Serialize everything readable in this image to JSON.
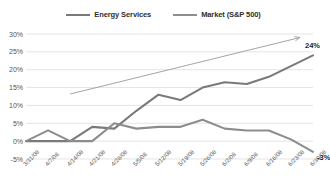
{
  "chart_data": {
    "type": "line",
    "title": "",
    "xlabel": "",
    "ylabel": "",
    "ylim": [
      -5,
      30
    ],
    "yticks": [
      "-5%",
      "0%",
      "5%",
      "10%",
      "15%",
      "20%",
      "25%",
      "30%"
    ],
    "ytick_values": [
      -5,
      0,
      5,
      10,
      15,
      20,
      25,
      30
    ],
    "grid": true,
    "legend_position": "top-center",
    "categories": [
      "3/31/08",
      "4/7/08",
      "4/14/08",
      "4/21/08",
      "4/28/08",
      "5/5/08",
      "5/12/08",
      "5/19/08",
      "5/26/08",
      "6/2/08",
      "6/9/08",
      "6/16/08",
      "6/23/08",
      "6/30/08"
    ],
    "series": [
      {
        "name": "Energy Services",
        "color": "#7a7a7a",
        "values": [
          0,
          0,
          0,
          4,
          3.5,
          8.5,
          13,
          11.5,
          15,
          16.5,
          16,
          18,
          21,
          24
        ],
        "end_label": "24%"
      },
      {
        "name": "Market (S&P 500)",
        "color": "#8d8d8d",
        "values": [
          0,
          3,
          0,
          0,
          5,
          3.5,
          4,
          4,
          6,
          3.5,
          3,
          3,
          0.5,
          -3
        ],
        "end_label": "-3%"
      }
    ],
    "annotations": [
      {
        "type": "trend-arrow",
        "from": {
          "x_index": 2.0,
          "y": 13.2
        },
        "to": {
          "x_index": 12.4,
          "y": 29.0
        },
        "color": "#9a9a9a"
      }
    ],
    "data_labels": [
      {
        "text": "24%",
        "series": "Energy Services",
        "x_index": 13,
        "y": 24
      },
      {
        "text": "-3%",
        "series": "Market (S&P 500)",
        "x_index": 13,
        "y": -3
      }
    ]
  },
  "legend": {
    "entries": [
      {
        "label": "Energy Services",
        "swatch": "line-swatch-energy"
      },
      {
        "label": "Market (S&P 500)",
        "swatch": "line-swatch-market"
      }
    ]
  }
}
